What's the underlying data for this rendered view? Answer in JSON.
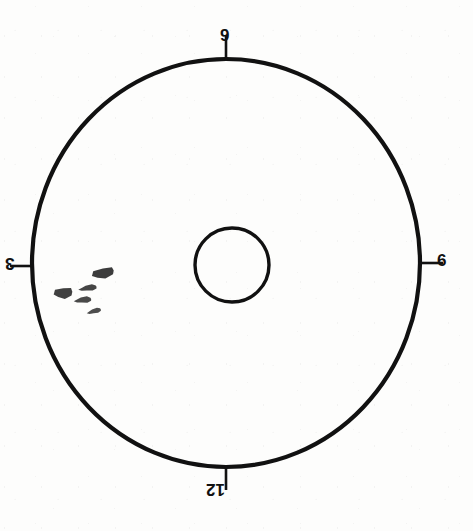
{
  "diagram": {
    "background_color": "#fdfdfc",
    "stroke_color": "#111111",
    "canvas": {
      "width": 473,
      "height": 531
    },
    "outer_circle": {
      "center_x": 226,
      "center_y": 263,
      "radius_x": 194,
      "radius_y": 204,
      "stroke_width": 4.2
    },
    "inner_circle": {
      "center_x": 232,
      "center_y": 265,
      "radius_x": 37,
      "radius_y": 37,
      "stroke_width": 3.4
    },
    "tick_marks": [
      {
        "name": "tick-top",
        "x1": 226,
        "y1": 36,
        "x2": 226,
        "y2": 61
      },
      {
        "name": "tick-right",
        "x1": 418,
        "y1": 263,
        "x2": 443,
        "y2": 263
      },
      {
        "name": "tick-bottom",
        "x1": 226,
        "y1": 466,
        "x2": 226,
        "y2": 490
      },
      {
        "name": "tick-left",
        "x1": 10,
        "y1": 266,
        "x2": 33,
        "y2": 266
      }
    ],
    "labels": {
      "top": "9",
      "right": "6",
      "bottom": "12",
      "left": "3"
    },
    "label_rotations": {
      "top": "0deg",
      "right": "0deg",
      "bottom": "180deg",
      "left": "180deg"
    },
    "particles": {
      "fill_color": "#2b2b2b",
      "count": 5,
      "items": [
        {
          "name": "particle-diamond-upper",
          "cx": 104,
          "cy": 273,
          "rx": 12.5,
          "ry": 5.2,
          "rotation": -14,
          "shape": "diamond",
          "opacity": 0.92
        },
        {
          "name": "particle-diamond-left",
          "cx": 64,
          "cy": 293,
          "rx": 10.5,
          "ry": 5.4,
          "rotation": -8,
          "shape": "diamond",
          "opacity": 0.9
        },
        {
          "name": "particle-sliver-mid",
          "cx": 89,
          "cy": 288,
          "rx": 9.5,
          "ry": 2.8,
          "rotation": -9,
          "shape": "sliver",
          "opacity": 0.88
        },
        {
          "name": "particle-sliver-lower",
          "cx": 84,
          "cy": 300,
          "rx": 9.0,
          "ry": 2.9,
          "rotation": -7,
          "shape": "sliver",
          "opacity": 0.86
        },
        {
          "name": "particle-sliver-bottom",
          "cx": 95,
          "cy": 311,
          "rx": 7.5,
          "ry": 2.4,
          "rotation": -16,
          "shape": "sliver",
          "opacity": 0.84
        }
      ]
    }
  }
}
